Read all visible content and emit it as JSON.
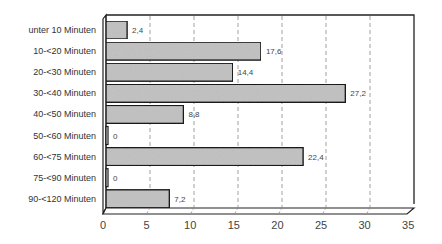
{
  "chart_data": {
    "type": "bar",
    "orientation": "horizontal",
    "style": "3d",
    "title": "",
    "xlabel": "",
    "ylabel": "",
    "categories": [
      "unter 10 Minuten",
      "10-<20 Minuten",
      "20-<30 Minuten",
      "30-<40 Minuten",
      "40-<50 Minuten",
      "50-<60 Minuten",
      "60-<75 Minuten",
      "75-<90 Minuten",
      "90-<120 Minuten"
    ],
    "values": [
      2.4,
      17.6,
      14.4,
      27.2,
      8.8,
      0,
      22.4,
      0,
      7.2
    ],
    "value_labels": [
      "2,4",
      "17,6",
      "14,4",
      "27,2",
      "8,8",
      "0",
      "22,4",
      "0",
      "7,2"
    ],
    "xlim": [
      0,
      35
    ],
    "xticks": [
      0,
      5,
      10,
      15,
      20,
      25,
      30,
      35
    ],
    "xtick_labels": [
      "0",
      "5",
      "10",
      "15",
      "20",
      "25",
      "30",
      "35"
    ],
    "grid": "vertical dashed",
    "legend": "none",
    "colors": {
      "bar_fill": "#c4c4c4",
      "bar_stroke": "#1a1a1a",
      "grid": "#888888",
      "axis": "#222222"
    }
  }
}
